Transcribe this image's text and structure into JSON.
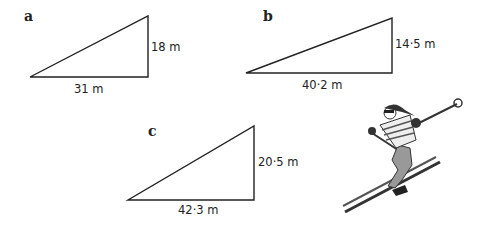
{
  "figures": [
    {
      "label": "a",
      "base": "31 m",
      "height": "18 m"
    },
    {
      "label": "b",
      "base": "40·2 m",
      "height": "14·5 m"
    },
    {
      "label": "c",
      "base": "42·3 m",
      "height": "20·5 m"
    }
  ],
  "illustration": "skier-image"
}
